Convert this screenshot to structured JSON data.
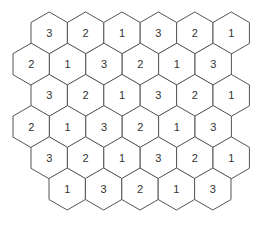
{
  "diagram": {
    "type": "hexagonal-number-grid",
    "hex": {
      "width": 36.4,
      "row_spacing": 31.2,
      "side": 21,
      "stroke": "#555555",
      "fill": "#ffffff",
      "text_color": "#333333"
    },
    "rows": [
      {
        "left": 31,
        "values": [
          "3",
          "2",
          "1",
          "3",
          "2",
          "1"
        ]
      },
      {
        "left": 13,
        "values": [
          "2",
          "1",
          "3",
          "2",
          "1",
          "3"
        ]
      },
      {
        "left": 31,
        "values": [
          "3",
          "2",
          "1",
          "3",
          "2",
          "1"
        ]
      },
      {
        "left": 13,
        "values": [
          "2",
          "1",
          "3",
          "2",
          "1",
          "3"
        ]
      },
      {
        "left": 31,
        "values": [
          "3",
          "2",
          "1",
          "3",
          "2",
          "1"
        ]
      },
      {
        "left": 49,
        "values": [
          "1",
          "3",
          "2",
          "1",
          "3"
        ]
      }
    ],
    "top_first_center": 33
  }
}
